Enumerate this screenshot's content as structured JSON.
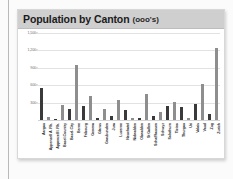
{
  "chart": {
    "title_main": "Population by Canton",
    "title_sub": "(ooo's)"
  },
  "chart_data": {
    "type": "bar",
    "title": "Population by Canton (ooo's)",
    "xlabel": "",
    "ylabel": "",
    "ylim": [
      0,
      1500
    ],
    "yticks": [
      "300",
      "600",
      "900",
      "1,200",
      "1,500"
    ],
    "ytick_values": [
      300,
      600,
      900,
      1200,
      1500
    ],
    "grid": true,
    "legend": "none",
    "categories": [
      "Aargau",
      "Appenzell A. Rh.",
      "Appenzell I. Rh.",
      "Basel-Country",
      "Basel-City",
      "Berne",
      "Fribourg",
      "Geneva",
      "Glarus",
      "Graubunden",
      "Jura",
      "Lucerne",
      "Neuchatel",
      "Nidwalden",
      "Obwalden",
      "St Gallen",
      "Schaffhausen",
      "Schwyz",
      "Solothurn",
      "Ticino",
      "Thurgau",
      "Uri",
      "Valais",
      "Vaud",
      "Zug",
      "Zurich"
    ],
    "values": [
      550,
      55,
      15,
      260,
      190,
      940,
      240,
      410,
      38,
      185,
      69,
      350,
      167,
      39,
      33,
      450,
      74,
      135,
      245,
      315,
      230,
      35,
      280,
      615,
      100,
      1250
    ],
    "colors": {
      "bar_dark": "#3a3a3a",
      "bar_light": "#8e8e8e",
      "grid": "#e2e2e2",
      "title_bar": "#cfcfcf",
      "panel": "#ffffff"
    }
  }
}
